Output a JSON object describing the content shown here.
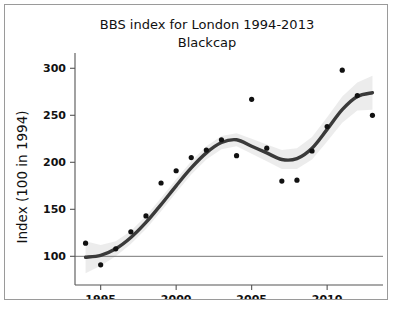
{
  "chart_data": {
    "type": "scatter",
    "title": "BBS index for London 1994-2013",
    "subtitle": "Blackcap",
    "xlabel": "",
    "ylabel": "Index (100 in 1994)",
    "xlim": [
      1993.3,
      2013.7
    ],
    "ylim": [
      78,
      312
    ],
    "xticks": [
      1995,
      2000,
      2005,
      2010
    ],
    "xtick_labels": [
      "1995",
      "2000",
      "2005",
      "2010"
    ],
    "yticks": [
      100,
      150,
      200,
      250,
      300
    ],
    "ytick_labels": [
      "100",
      "150",
      "200",
      "250",
      "300"
    ],
    "grid": false,
    "legend": "none",
    "reference_line": {
      "y": 100,
      "label": "100 in 1994"
    },
    "x": [
      1994,
      1995,
      1996,
      1997,
      1998,
      1999,
      2000,
      2001,
      2002,
      2003,
      2004,
      2005,
      2006,
      2007,
      2008,
      2009,
      2010,
      2011,
      2012,
      2013
    ],
    "values": [
      114,
      91,
      108,
      126,
      143,
      178,
      191,
      205,
      213,
      224,
      207,
      267,
      215,
      180,
      181,
      212,
      238,
      298,
      271,
      250
    ],
    "series": [
      {
        "name": "Annual index",
        "type": "scatter",
        "values": [
          114,
          91,
          108,
          126,
          143,
          178,
          191,
          205,
          213,
          224,
          207,
          267,
          215,
          180,
          181,
          212,
          238,
          298,
          271,
          250
        ]
      },
      {
        "name": "Smoothed trend",
        "type": "line",
        "values": [
          99,
          101,
          108,
          120,
          136,
          155,
          175,
          194,
          210,
          221,
          224,
          217,
          210,
          203,
          204,
          215,
          235,
          256,
          270,
          274
        ]
      },
      {
        "name": "Confidence band upper",
        "type": "band",
        "values": [
          116,
          112,
          116,
          127,
          143,
          162,
          182,
          201,
          217,
          228,
          231,
          225,
          219,
          213,
          215,
          227,
          248,
          270,
          285,
          292
        ]
      },
      {
        "name": "Confidence band lower",
        "type": "band",
        "values": [
          82,
          90,
          100,
          113,
          129,
          148,
          168,
          187,
          203,
          214,
          217,
          209,
          201,
          193,
          193,
          203,
          222,
          242,
          255,
          256
        ]
      }
    ],
    "colors": {
      "point": "#111111",
      "trend_line": "#3a3a3a",
      "confidence_band": "#e9e9e9",
      "axis": "#555555",
      "reference_line": "#777777",
      "background": "#ffffff",
      "border": "#9a9a9a"
    }
  },
  "footer": {
    "caption": ""
  }
}
